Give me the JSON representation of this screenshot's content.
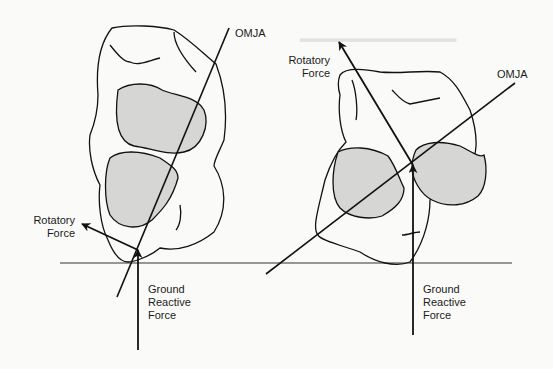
{
  "figure": {
    "left_panel": {
      "axis_label": "OMJA",
      "rotatory_force_label_line1": "Rotatory",
      "rotatory_force_label_line2": "Force",
      "ground_force_label_line1": "Ground",
      "ground_force_label_line2": "Reactive",
      "ground_force_label_line3": "Force"
    },
    "right_panel": {
      "axis_label": "OMJA",
      "rotatory_force_label_line1": "Rotatory",
      "rotatory_force_label_line2": "Force",
      "ground_force_label_line1": "Ground",
      "ground_force_label_line2": "Reactive",
      "ground_force_label_line3": "Force"
    },
    "colors": {
      "background": "#fafaf8",
      "ink": "#111111",
      "shading": "#d6d6d4",
      "bleed_through": "#e4e4e0"
    }
  }
}
